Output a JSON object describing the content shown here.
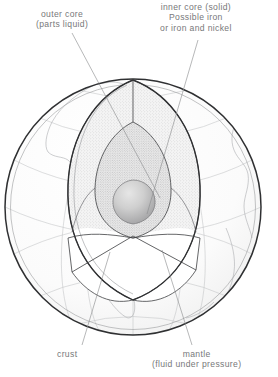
{
  "figure": {
    "background_color": "#ffffff",
    "text_color": "#77787a",
    "line_color": "#3f4042",
    "globe": {
      "center_x": 133,
      "center_y": 207,
      "radius": 129,
      "outline_color": "#2f3032",
      "graticule_color": "#b9bbbd",
      "coastline_color": "#adafb1"
    }
  },
  "labels": {
    "outer_core": {
      "line1": "outer core",
      "line2": "(parts liquid)"
    },
    "inner_core": {
      "line1": "inner core  (solid)",
      "line2": "Possible iron",
      "line3": "or iron and nickel"
    },
    "crust": {
      "line1": "crust"
    },
    "mantle": {
      "line1": "mantle",
      "line2": "(fluid under pressure)"
    }
  },
  "layers": [
    {
      "name": "crust",
      "description": "thin dark outer shell of the globe",
      "fill": "#f2f2f2"
    },
    {
      "name": "mantle",
      "description": "fluid under pressure",
      "fill": "#efefef"
    },
    {
      "name": "outer_core",
      "description": "parts liquid",
      "fill": "#e3e3e3"
    },
    {
      "name": "inner_core",
      "description": "solid, possible iron or iron and nickel",
      "fill": "#c9c9c9"
    }
  ]
}
